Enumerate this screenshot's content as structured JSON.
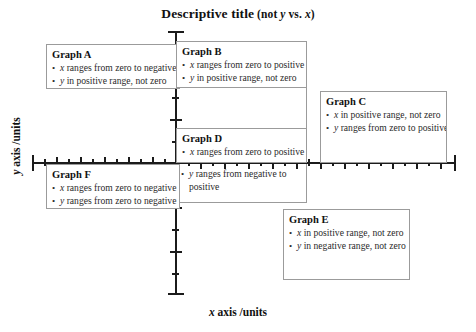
{
  "chart_data": {
    "type": "scatter",
    "title": "Descriptive title (not y vs. x)",
    "title_parts": {
      "main": "Descriptive title",
      "paren_open": "(not ",
      "var1": "y",
      "mid": " vs. ",
      "var2": "x",
      "paren_close": ")"
    },
    "xlabel": "x axis /units",
    "xlabel_parts": {
      "var": "x",
      "rest": " axis /units"
    },
    "ylabel": "y axis /units",
    "ylabel_parts": {
      "var": "y",
      "rest": " axis /units"
    },
    "origin_label": "0",
    "grid": false,
    "legend": "none",
    "axes": {
      "style": "crossed-at-origin",
      "x_ticks_major": 9,
      "x_ticks_minor": 18,
      "y_ticks_major": 6,
      "y_ticks_minor": 12,
      "origin_x_fraction": 0.34,
      "origin_y_fraction": 0.5
    },
    "annotations": [
      {
        "id": "A",
        "title": "Graph A",
        "quadrant": "upper-left",
        "bullets": [
          {
            "var": "x",
            "text": " ranges from zero to negative"
          },
          {
            "var": "y",
            "text": " in positive range, not zero"
          }
        ]
      },
      {
        "id": "B",
        "title": "Graph B",
        "quadrant": "upper-right-near-axis",
        "bullets": [
          {
            "var": "x",
            "text": " ranges from zero to positive"
          },
          {
            "var": "y",
            "text": " in positive range, not zero"
          }
        ]
      },
      {
        "id": "C",
        "title": "Graph C",
        "quadrant": "upper-right-far",
        "bullets": [
          {
            "var": "x",
            "text": " in positive range, not zero"
          },
          {
            "var": "y",
            "text": " ranges from zero to positive"
          }
        ]
      },
      {
        "id": "D",
        "title": "Graph D",
        "quadrant": "straddling-x-axis-right",
        "bullets": [
          {
            "var": "x",
            "text": " ranges from zero to positive"
          },
          {
            "var": "y",
            "text": " ranges from negative to positive"
          }
        ]
      },
      {
        "id": "E",
        "title": "Graph E",
        "quadrant": "lower-right",
        "bullets": [
          {
            "var": "x",
            "text": " in positive range, not zero"
          },
          {
            "var": "y",
            "text": " in negative range, not zero"
          }
        ]
      },
      {
        "id": "F",
        "title": "Graph F",
        "quadrant": "lower-left",
        "bullets": [
          {
            "var": "x",
            "text": " ranges from zero to negative"
          },
          {
            "var": "y",
            "text": " ranges from zero to negative"
          }
        ]
      }
    ]
  }
}
